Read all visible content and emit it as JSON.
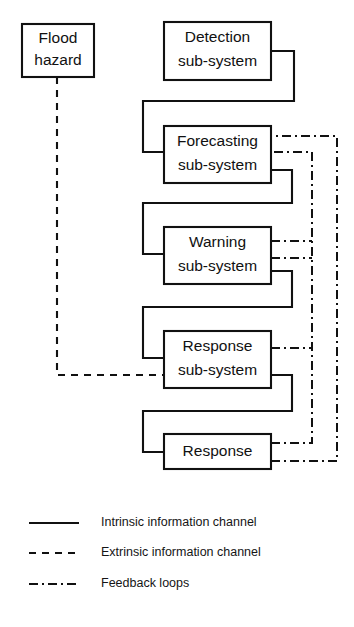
{
  "diagram": {
    "colors": {
      "line": "#111111",
      "background": "#ffffff",
      "text": "#151515"
    },
    "nodes": [
      {
        "id": "flood-hazard",
        "line1": "Flood",
        "line2": "hazard",
        "x": 22,
        "y": 24,
        "w": 72,
        "h": 53
      },
      {
        "id": "detection",
        "line1": "Detection",
        "line2": "sub-system",
        "x": 164,
        "y": 22,
        "w": 107,
        "h": 58
      },
      {
        "id": "forecasting",
        "line1": "Forecasting",
        "line2": "sub-system",
        "x": 164,
        "y": 126,
        "w": 107,
        "h": 57
      },
      {
        "id": "warning",
        "line1": "Warning",
        "line2": "sub-system",
        "x": 164,
        "y": 227,
        "w": 107,
        "h": 57
      },
      {
        "id": "response-sub-system",
        "line1": "Response",
        "line2": "sub-system",
        "x": 164,
        "y": 331,
        "w": 107,
        "h": 57
      },
      {
        "id": "response",
        "line1": "Response",
        "line2": "",
        "x": 164,
        "y": 434,
        "w": 107,
        "h": 35
      }
    ],
    "legend": {
      "items": [
        {
          "id": "intrinsic",
          "style": "solid",
          "label": "Intrinsic information channel"
        },
        {
          "id": "extrinsic",
          "style": "dashed",
          "label": "Extrinsic information channel"
        },
        {
          "id": "feedback",
          "style": "dashdot",
          "label": "Feedback loops"
        }
      ]
    }
  }
}
